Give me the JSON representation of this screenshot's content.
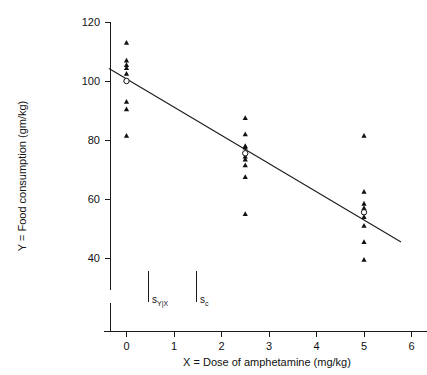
{
  "chart_data": {
    "type": "scatter",
    "title": "",
    "xlabel": "X = Dose of amphetamine (mg/kg)",
    "ylabel": "Y = Food consumption (gm/kg)",
    "xlim": [
      -0.45,
      6.0
    ],
    "ylim": [
      33,
      122
    ],
    "xticks": [
      0,
      1,
      2,
      3,
      4,
      5,
      6
    ],
    "xticklabels": [
      "0",
      "1",
      "2",
      "3",
      "4",
      "5",
      "6"
    ],
    "yticks": [
      40,
      60,
      80,
      100,
      120
    ],
    "yticklabels": [
      "40",
      "60",
      "80",
      "100",
      "120"
    ],
    "grid": false,
    "legend": "none",
    "axis_break_y": true,
    "groups": [
      {
        "x": 0,
        "mean_y": 100.0,
        "values": [
          113.0,
          107.0,
          105.5,
          104.5,
          102.5,
          93.0,
          90.5,
          81.5
        ]
      },
      {
        "x": 2.5,
        "mean_y": 75.5,
        "values": [
          87.5,
          82.0,
          78.0,
          77.5,
          74.5,
          73.5,
          71.5,
          67.5,
          55.0
        ]
      },
      {
        "x": 5.0,
        "mean_y": 55.5,
        "values": [
          81.5,
          62.5,
          58.5,
          57.0,
          54.0,
          51.0,
          45.5,
          39.5
        ]
      }
    ],
    "regression_line": {
      "x_start": -0.35,
      "y_start": 107.0,
      "x_end": 5.8,
      "y_end": 48.0
    },
    "annotations": [
      {
        "name": "s-y-given-x",
        "label": "s",
        "subscript": "Y|X",
        "x": 0.47,
        "y_top": 90.5,
        "y_bottom": 100.0
      },
      {
        "name": "s-c",
        "label": "s",
        "subscript": "c",
        "x": 1.48,
        "y_top": 90.5,
        "y_bottom": 100.0
      }
    ]
  },
  "axes": {
    "y_title": "Y = Food consumption (gm/kg)",
    "x_title_prefix": "X",
    "x_title_eq": "=",
    "x_title_rest": "Dose of amphetamine (mg/kg)",
    "x_title_full": "X = Dose of amphetamine (mg/kg)"
  },
  "annotations": {
    "syx": {
      "base": "s",
      "sub": "Y|X"
    },
    "sc": {
      "base": "s",
      "sub": "c"
    }
  }
}
